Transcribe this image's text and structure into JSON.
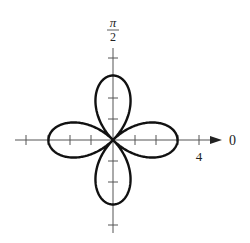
{
  "chart_data": {
    "type": "line",
    "subtype": "polar",
    "title": "",
    "curve": {
      "description": "four-petal rose (fitted, not labeled on plot)",
      "equation": "r = 3cos(2θ)",
      "amplitude": 3,
      "petals": 4,
      "petal_tips_theta": [
        "0",
        "π/2",
        "π",
        "3π/2"
      ],
      "points_polar_sample": [
        {
          "theta": "0",
          "r": 3
        },
        {
          "theta": "π/4",
          "r": 0
        },
        {
          "theta": "π/2",
          "r": 3
        },
        {
          "theta": "3π/4",
          "r": 0
        },
        {
          "theta": "π",
          "r": 3
        },
        {
          "theta": "5π/4",
          "r": 0
        },
        {
          "theta": "3π/2",
          "r": 3
        },
        {
          "theta": "7π/4",
          "r": 0
        }
      ]
    },
    "axes": {
      "polar_axis_label": "0",
      "vertical_axis_label": "π/2",
      "radial_tick_label": "4",
      "radial_ticks": [
        1,
        2,
        3,
        4
      ],
      "range": [
        -4,
        4
      ]
    },
    "grid": false,
    "legend": null
  },
  "labels": {
    "pi": "π",
    "two": "2",
    "zero": "0",
    "four": "4"
  }
}
